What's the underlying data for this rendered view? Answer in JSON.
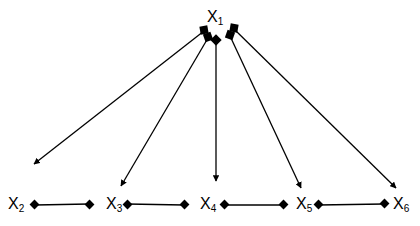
{
  "diagram": {
    "title": "",
    "colors": {
      "stroke": "#000000",
      "background": "#ffffff"
    },
    "nodes": [
      {
        "id": "X1",
        "base": "X",
        "sub": "1",
        "x": 207,
        "y": 9
      },
      {
        "id": "X2",
        "base": "X",
        "sub": "2",
        "x": 8,
        "y": 196
      },
      {
        "id": "X3",
        "base": "X",
        "sub": "3",
        "x": 106,
        "y": 196
      },
      {
        "id": "X4",
        "base": "X",
        "sub": "4",
        "x": 200,
        "y": 196
      },
      {
        "id": "X5",
        "base": "X",
        "sub": "5",
        "x": 296,
        "y": 196
      },
      {
        "id": "X6",
        "base": "X",
        "sub": "6",
        "x": 393,
        "y": 196
      }
    ],
    "directed_edges": [
      {
        "from": "X1",
        "to": "X2"
      },
      {
        "from": "X1",
        "to": "X3"
      },
      {
        "from": "X1",
        "to": "X4"
      },
      {
        "from": "X1",
        "to": "X5"
      },
      {
        "from": "X1",
        "to": "X6"
      }
    ],
    "undirected_edges": [
      {
        "from": "X2",
        "to": "X3"
      },
      {
        "from": "X4",
        "to": "X5"
      },
      {
        "from": "X5",
        "to": "X6"
      },
      {
        "from": "X3",
        "to": "X4"
      }
    ],
    "endpoint_markers": {
      "source": "square/diamond",
      "target": "arrowhead",
      "link": "diamond"
    }
  }
}
